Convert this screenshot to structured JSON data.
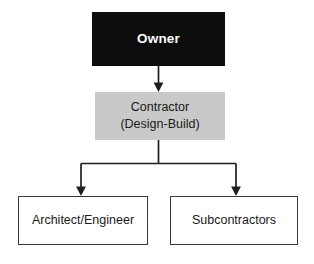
{
  "diagram": {
    "type": "organizational-hierarchy",
    "nodes": [
      {
        "id": "owner",
        "label": "Owner",
        "lines": [
          "Owner"
        ],
        "fill": "#0d0d0d",
        "text_color": "#ffffff",
        "bold": true,
        "level": 0
      },
      {
        "id": "contractor",
        "label": "Contractor (Design-Build)",
        "lines": [
          "Contractor",
          "(Design-Build)"
        ],
        "fill": "#c9c9c9",
        "text_color": "#1a1a1a",
        "bold": false,
        "level": 1
      },
      {
        "id": "architect",
        "label": "Architect/Engineer",
        "lines": [
          "Architect/Engineer"
        ],
        "fill": "#ffffff",
        "text_color": "#1a1a1a",
        "bold": false,
        "level": 2
      },
      {
        "id": "subcontractors",
        "label": "Subcontractors",
        "lines": [
          "Subcontractors"
        ],
        "fill": "#ffffff",
        "text_color": "#1a1a1a",
        "bold": false,
        "level": 2
      }
    ],
    "edges": [
      {
        "from": "owner",
        "to": "contractor",
        "style": "straight-arrow"
      },
      {
        "from": "contractor",
        "to": "architect",
        "style": "elbow-arrow"
      },
      {
        "from": "contractor",
        "to": "subcontractors",
        "style": "elbow-arrow"
      }
    ],
    "line_color": "#1f1f1f"
  }
}
